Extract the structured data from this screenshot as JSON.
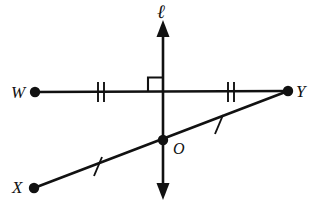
{
  "figure": {
    "background_color": "#ffffff",
    "stroke_color": "#111111",
    "width": 315,
    "height": 210
  },
  "labels": {
    "line_ell": "ℓ",
    "point_W": "W",
    "point_X": "X",
    "point_Y": "Y",
    "point_O": "O"
  },
  "points": {
    "W": {
      "name": "W",
      "x": 35,
      "y": 92
    },
    "Y": {
      "name": "Y",
      "x": 288,
      "y": 91
    },
    "X": {
      "name": "X",
      "x": 34,
      "y": 188
    },
    "O": {
      "name": "O",
      "x": 163,
      "y": 140
    },
    "M": {
      "name": "intersection-of-ell-and-WY",
      "x": 163,
      "y": 92
    }
  },
  "segments": [
    {
      "name": "segment-WY",
      "from": "W",
      "to": "Y",
      "tick_count": 2
    },
    {
      "name": "segment-XY",
      "from": "X",
      "to": "Y",
      "tick_count": 1
    }
  ],
  "line_ell": {
    "name": "line-ell",
    "x": 163,
    "top_y": 22,
    "bottom_y": 198,
    "arrows": "both"
  },
  "tick_marks": [
    {
      "name": "tick-WM",
      "segment": "segment-WY",
      "x": 101,
      "y": 92,
      "count": 2
    },
    {
      "name": "tick-MY",
      "segment": "segment-WY",
      "x": 231,
      "y": 92,
      "count": 2
    },
    {
      "name": "tick-XO",
      "segment": "segment-XY",
      "x": 98,
      "y": 166,
      "count": 1
    },
    {
      "name": "tick-OY",
      "segment": "segment-XY",
      "x": 219,
      "y": 125,
      "count": 1
    }
  ],
  "right_angle": {
    "name": "right-angle-mark",
    "vertex_x": 163,
    "vertex_y": 92,
    "size": 15,
    "quadrant": "upper-left"
  },
  "colors": {
    "stroke": "#111111",
    "background": "#ffffff"
  }
}
